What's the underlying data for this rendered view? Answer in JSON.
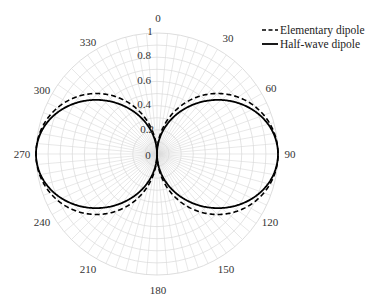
{
  "chart_data": {
    "type": "polar-line",
    "title": "",
    "theta_direction": "clockwise",
    "theta_zero_location": "top",
    "angular_ticks": [
      "0",
      "30",
      "60",
      "90",
      "120",
      "150",
      "180",
      "210",
      "240",
      "270",
      "300",
      "330"
    ],
    "radial_ticks": [
      "0",
      "0.2",
      "0.4",
      "0.6",
      "0.8",
      "1"
    ],
    "rlim": [
      0,
      1
    ],
    "grid": {
      "radial_step_deg": 5,
      "ring_step": 0.1
    },
    "legend": {
      "position": "upper right",
      "entries": [
        {
          "label": "Elementary dipole",
          "style": "dashed"
        },
        {
          "label": "Half-wave dipole",
          "style": "solid"
        }
      ]
    },
    "series": [
      {
        "name": "Elementary dipole",
        "formula": "|sin(theta)|",
        "theta_deg": [
          0,
          15,
          30,
          45,
          60,
          75,
          90,
          105,
          120,
          135,
          150,
          165,
          180,
          195,
          210,
          225,
          240,
          255,
          270,
          285,
          300,
          315,
          330,
          345,
          360
        ],
        "r": [
          0.0,
          0.259,
          0.5,
          0.707,
          0.866,
          0.966,
          1.0,
          0.966,
          0.866,
          0.707,
          0.5,
          0.259,
          0.0,
          0.259,
          0.5,
          0.707,
          0.866,
          0.966,
          1.0,
          0.966,
          0.866,
          0.707,
          0.5,
          0.259,
          0.0
        ]
      },
      {
        "name": "Half-wave dipole",
        "formula": "|cos(pi/2 cos(theta)) / sin(theta)|",
        "theta_deg": [
          0,
          15,
          30,
          45,
          60,
          75,
          90,
          105,
          120,
          135,
          150,
          165,
          180,
          195,
          210,
          225,
          240,
          255,
          270,
          285,
          300,
          315,
          330,
          345,
          360
        ],
        "r": [
          0.0,
          0.18,
          0.42,
          0.63,
          0.82,
          0.95,
          1.0,
          0.95,
          0.82,
          0.63,
          0.42,
          0.18,
          0.0,
          0.18,
          0.42,
          0.63,
          0.82,
          0.95,
          1.0,
          0.95,
          0.82,
          0.63,
          0.42,
          0.18,
          0.0
        ]
      }
    ]
  },
  "labels": {
    "legend_elementary": "Elementary dipole",
    "legend_halfwave": "Half-wave dipole",
    "ang_0": "0",
    "ang_30": "30",
    "ang_60": "60",
    "ang_90": "90",
    "ang_120": "120",
    "ang_150": "150",
    "ang_180": "180",
    "ang_210": "210",
    "ang_240": "240",
    "ang_270": "270",
    "ang_300": "300",
    "ang_330": "330",
    "r_0": "0",
    "r_02": "0.2",
    "r_04": "0.4",
    "r_06": "0.6",
    "r_08": "0.8",
    "r_1": "1"
  },
  "colors": {
    "grid": "#d9d9d9",
    "curve": "#000000",
    "text": "#333333"
  }
}
